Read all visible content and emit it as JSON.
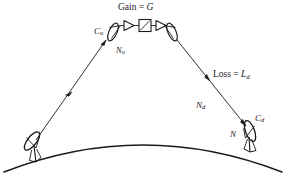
{
  "diagram": {
    "background_color": "#ffffff",
    "stroke_color": "#1a1a1a",
    "labels": {
      "gain": {
        "prefix": "Gain = ",
        "symbol": "G",
        "subscript": ""
      },
      "loss": {
        "prefix": "Loss = ",
        "symbol": "L",
        "subscript": "d"
      },
      "carrier_uplink": {
        "prefix": "",
        "symbol": "C",
        "subscript": "u"
      },
      "noise_uplink": {
        "prefix": "",
        "symbol": "N",
        "subscript": "u"
      },
      "noise_downlink": {
        "prefix": "",
        "symbol": "N",
        "subscript": "d"
      },
      "carrier_downlink": {
        "prefix": "",
        "symbol": "C",
        "subscript": "d"
      },
      "noise_receiver": {
        "prefix": "",
        "symbol": "N",
        "subscript": ""
      }
    },
    "elements": {
      "satellite_rx_antenna": "satellite-receive-dish",
      "satellite_tx_antenna": "satellite-transmit-dish",
      "transponder_amplifier_in": "amplifier-triangle-input",
      "transponder_converter": "frequency-converter-box",
      "transponder_amplifier_out": "amplifier-triangle-output",
      "earth_station_tx": "uplink-earth-station-dish",
      "earth_station_rx": "downlink-earth-station-dish",
      "earth_curve": "earth-horizon-arc",
      "uplink_path": "uplink-signal-path-arrow",
      "downlink_path": "downlink-signal-path-arrow"
    }
  }
}
